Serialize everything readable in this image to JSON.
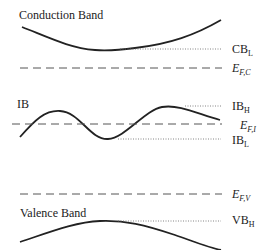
{
  "diagram": {
    "bands": {
      "conduction": {
        "label": "Conduction Band"
      },
      "intermediate": {
        "label": "IB"
      },
      "valence": {
        "label": "Valence Band"
      }
    },
    "levels": {
      "cb_low": {
        "main": "CB",
        "sub": "L"
      },
      "ef_c": {
        "main": "E",
        "sub": "F,C"
      },
      "ib_high": {
        "main": "IB",
        "sub": "H"
      },
      "ef_i": {
        "main": "E",
        "sub": "F,I"
      },
      "ib_low": {
        "main": "IB",
        "sub": "L"
      },
      "ef_v": {
        "main": "E",
        "sub": "F,V"
      },
      "vb_high": {
        "main": "VB",
        "sub": "H"
      }
    },
    "colors": {
      "line": "#222222",
      "dotted": "#666666",
      "dashed": "#555555"
    }
  }
}
